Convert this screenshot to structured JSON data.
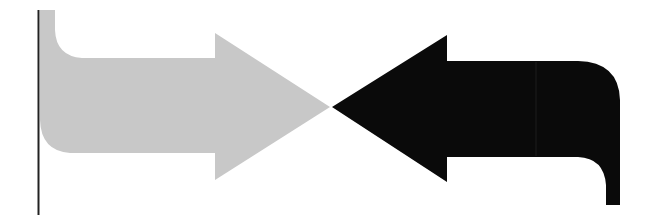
{
  "diagram": {
    "left_arrow": {
      "direction": "right",
      "color": "#c8c8c8",
      "label": ""
    },
    "right_arrow": {
      "direction": "left",
      "color": "#0a0a0a",
      "label": ""
    },
    "left_border_line": {
      "color": "#222222"
    }
  }
}
